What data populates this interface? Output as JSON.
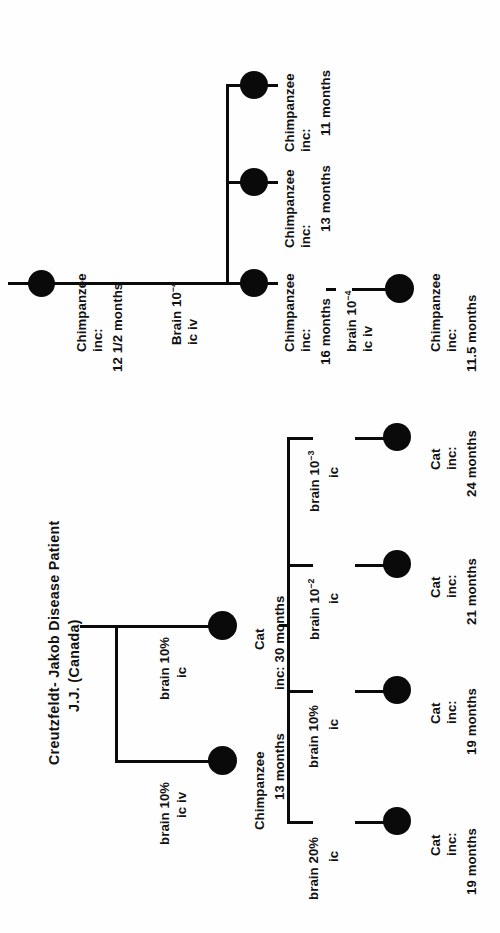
{
  "figure": {
    "title_line1": "Creutzfeldt- Jakob Disease Patient",
    "title_line2": "J.J. (Canada)",
    "orientation": "rotated-90-ccw",
    "ink_color": "#0a0a0a",
    "background_color": "#ffffff"
  },
  "upper_tree": {
    "root": {
      "species": "Chimpanzee",
      "inc_label": "inc:",
      "incubation": "12 1/2 months"
    },
    "root_edge": {
      "inoculum_line1": "Brain 10",
      "inoculum_exponent": "−4",
      "route": "ic iv"
    },
    "children": [
      {
        "species": "Chimpanzee",
        "inc_label": "inc:",
        "incubation": "16 months"
      },
      {
        "species": "Chimpanzee",
        "inc_label": "inc:",
        "incubation": "13 months"
      },
      {
        "species": "Chimpanzee",
        "inc_label": "inc:",
        "incubation": "11 months"
      }
    ],
    "grandchild_edge": {
      "inoculum_line1": "brain 10",
      "inoculum_exponent": "−4",
      "route": "ic iv"
    },
    "grandchild": {
      "species": "Chimpanzee",
      "inc_label": "inc:",
      "incubation": "11.5 months"
    }
  },
  "lower_tree": {
    "branch_edges": [
      {
        "inoculum": "brain 10%",
        "route": "ic iv"
      },
      {
        "inoculum": "brain 10%",
        "route": "ic"
      }
    ],
    "children": [
      {
        "species": "Chimpanzee",
        "incubation": "13 months"
      },
      {
        "species": "Cat",
        "incubation": "inc: 30 months"
      }
    ],
    "cat_edges": [
      {
        "inoculum_line1": "brain 20%",
        "inoculum_exponent": "",
        "route": "ic"
      },
      {
        "inoculum_line1": "brain 10%",
        "inoculum_exponent": "",
        "route": "ic"
      },
      {
        "inoculum_line1": "brain 10",
        "inoculum_exponent": "−2",
        "route": "ic"
      },
      {
        "inoculum_line1": "brain 10",
        "inoculum_exponent": "−3",
        "route": "ic"
      }
    ],
    "cats": [
      {
        "species": "Cat",
        "inc_label": "inc:",
        "incubation": "19 months"
      },
      {
        "species": "Cat",
        "inc_label": "inc:",
        "incubation": "19 months"
      },
      {
        "species": "Cat",
        "inc_label": "inc:",
        "incubation": "21 months"
      },
      {
        "species": "Cat",
        "inc_label": "inc:",
        "incubation": "24 months"
      }
    ]
  }
}
